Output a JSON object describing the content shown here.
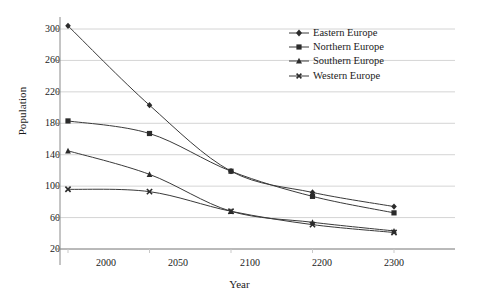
{
  "chart_data": {
    "type": "line",
    "title": "",
    "xlabel": "Year",
    "ylabel": "Population",
    "categories": [
      "2000",
      "2050",
      "2100",
      "2200",
      "2300"
    ],
    "ylim": [
      20,
      300
    ],
    "yticks": [
      20,
      60,
      100,
      140,
      180,
      220,
      260,
      300
    ],
    "grid": "horizontal",
    "legend_position": "top-right",
    "series": [
      {
        "name": "Eastern Europe",
        "marker": "diamond",
        "color": "#333333",
        "values": [
          304,
          203,
          119,
          92,
          74
        ]
      },
      {
        "name": "Northern Europe",
        "marker": "square",
        "color": "#333333",
        "values": [
          183,
          167,
          119,
          87,
          66
        ]
      },
      {
        "name": "Southern Europe",
        "marker": "triangle",
        "color": "#333333",
        "values": [
          145,
          115,
          68,
          54,
          43
        ]
      },
      {
        "name": "Western Europe",
        "marker": "cross",
        "color": "#333333",
        "values": [
          96,
          93,
          68,
          51,
          41
        ]
      }
    ]
  },
  "axis": {
    "y_title": "Population",
    "x_title": "Year",
    "y_tick_labels": [
      "300",
      "260",
      "220",
      "180",
      "140",
      "100",
      "60",
      "20"
    ],
    "x_tick_labels": [
      "2000",
      "2050",
      "2100",
      "2200",
      "2300"
    ]
  },
  "legend": {
    "items": [
      {
        "label": "Eastern Europe"
      },
      {
        "label": "Northern Europe"
      },
      {
        "label": "Southern Europe"
      },
      {
        "label": "Western Europe"
      }
    ]
  },
  "style": {
    "line_color": "#3a3a3a",
    "grid_color": "#c9c9c9",
    "axis_color": "#8a8a8a",
    "background": "#ffffff"
  }
}
